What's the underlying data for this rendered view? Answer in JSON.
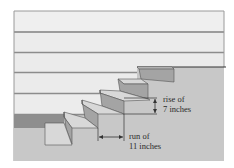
{
  "diagram": {
    "labels": {
      "rise_line1": "rise of",
      "rise_line2": "7 inches",
      "run_line1": "run of",
      "run_line2": "11 inches"
    },
    "measurements": {
      "rise_inches": 7,
      "run_inches": 11,
      "step_count": 6
    },
    "colors": {
      "wall_light": "#eeeeee",
      "siding_line": "#8c8c8c",
      "ground": "#c8c8c8",
      "tread": "#d6d6d6",
      "riser": "#a4a4a4",
      "edge": "#555555",
      "text": "#2a2a2a"
    }
  }
}
